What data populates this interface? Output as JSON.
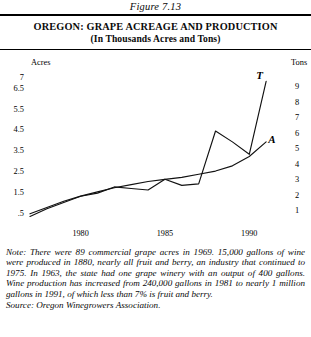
{
  "figure": {
    "caption": "Figure 7.13",
    "title_line1": "OREGON: GRAPE ACREAGE AND PRODUCTION",
    "title_line2": "(In Thousands Acres and Tons)"
  },
  "note": {
    "prefix": "Note:",
    "body": " There were 89 commercial grape acres in 1969. 15,000 gallons of wine were produced in 1880, nearly all fruit and berry, an industry that continued to 1975. In 1963, the state had one grape winery with an output of 400 gallons. Wine production has increased from 240,000 gallons in 1981 to nearly 1 million gallons in 1991, of which less than 7% is fruit and berry.",
    "source": "Source: Oregon Winegrowers Association."
  },
  "chart_data": {
    "type": "line",
    "title": "OREGON: GRAPE ACREAGE AND PRODUCTION",
    "subtitle": "(In Thousands Acres and Tons)",
    "xlabel": "",
    "ylabel": "Acres",
    "y2label": "Tons",
    "grid": false,
    "legend_position": "inline-end-of-line",
    "xlim": [
      1977,
      1992
    ],
    "xticks": [
      1980,
      1985,
      1990
    ],
    "xtick_labels": [
      "1980",
      "1985",
      "1990"
    ],
    "ylim": [
      0.25,
      7.25
    ],
    "yticks": [
      0.5,
      1.5,
      2.5,
      3.5,
      4.5,
      5.5,
      6.5,
      7
    ],
    "ytick_labels": [
      ".5",
      "1.5",
      "2.5",
      "3.5",
      "4.5",
      "5.5",
      "6.5",
      "7"
    ],
    "y2lim": [
      0.5,
      9.9
    ],
    "y2ticks": [
      1,
      2,
      3,
      4,
      5,
      6,
      7,
      8,
      9
    ],
    "y2tick_labels": [
      "1",
      "2",
      "3",
      "4",
      "5",
      "6",
      "7",
      "8",
      "9"
    ],
    "x": [
      1977,
      1978,
      1979,
      1980,
      1981,
      1982,
      1983,
      1984,
      1985,
      1986,
      1987,
      1988,
      1989,
      1990,
      1991
    ],
    "series": [
      {
        "name": "Tons",
        "label": "T",
        "axis": "right",
        "color": "#111111",
        "values": [
          0.6,
          1.1,
          1.5,
          1.9,
          2.1,
          2.5,
          2.4,
          2.3,
          3.0,
          2.6,
          2.7,
          6.1,
          5.4,
          4.6,
          9.3
        ]
      },
      {
        "name": "Acres",
        "label": "A",
        "axis": "left",
        "color": "#111111",
        "values": [
          0.45,
          0.75,
          1.05,
          1.3,
          1.5,
          1.7,
          1.85,
          2.0,
          2.1,
          2.2,
          2.35,
          2.5,
          2.75,
          3.2,
          3.9
        ]
      }
    ]
  }
}
